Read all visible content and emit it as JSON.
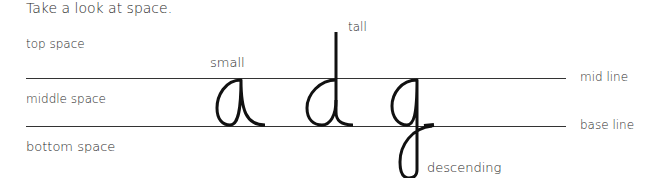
{
  "title": "Take a look at space.",
  "spaces": {
    "top": "top space",
    "middle": "middle space",
    "bottom": "bottom space"
  },
  "lines": {
    "mid": "mid line",
    "base": "base line"
  },
  "letters": [
    {
      "char": "a",
      "label": "small"
    },
    {
      "char": "d",
      "label": "tall"
    },
    {
      "char": "g",
      "label": "descending"
    }
  ]
}
